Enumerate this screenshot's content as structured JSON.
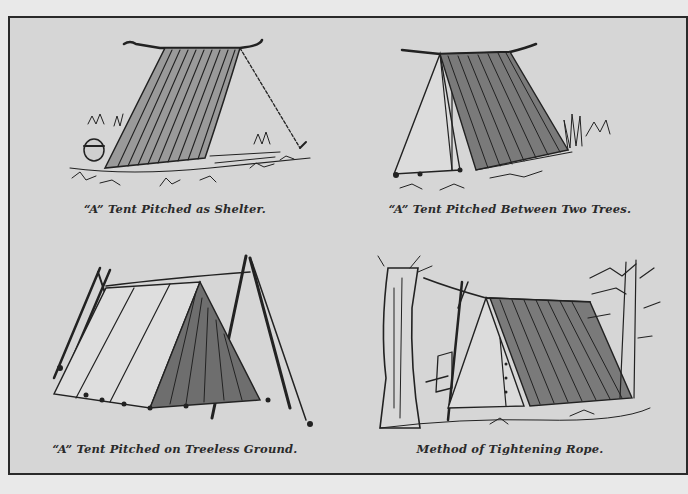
{
  "plate": {
    "background_color": "#d6d6d6",
    "border_color": "#2a2a2a",
    "panels": [
      {
        "id": "shelter",
        "caption": "“A” Tent Pitched as Shelter.",
        "illustration": "a-tent-as-shelter"
      },
      {
        "id": "two-trees",
        "caption": "“A” Tent Pitched Between Two Trees.",
        "illustration": "a-tent-between-trees"
      },
      {
        "id": "treeless",
        "caption": "“A” Tent Pitched on Treeless Ground.",
        "illustration": "a-tent-treeless-ground"
      },
      {
        "id": "tightening",
        "caption": "Method of Tightening Rope.",
        "illustration": "tightening-rope"
      }
    ]
  }
}
